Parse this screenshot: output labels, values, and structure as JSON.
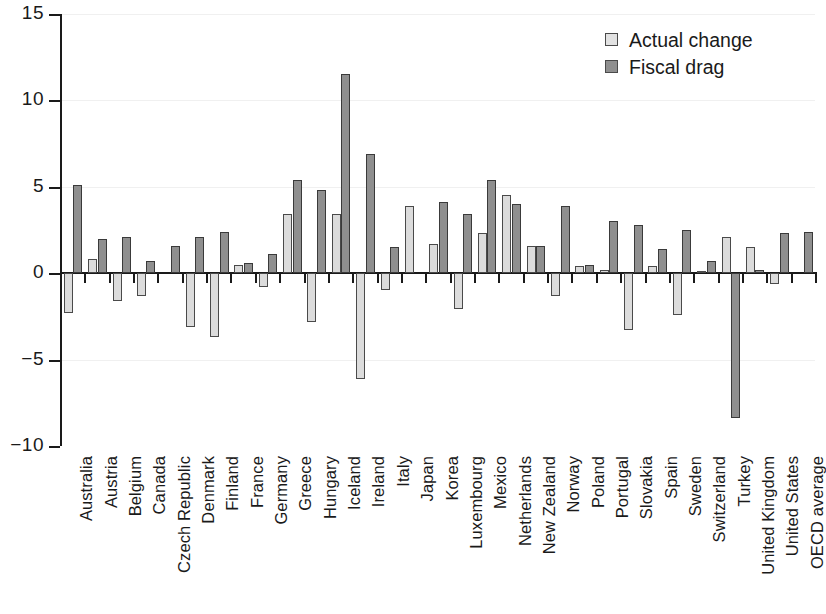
{
  "chart_data": {
    "type": "bar",
    "title": "",
    "subtitle": "",
    "xlabel": "",
    "ylabel": "",
    "ylim": [
      -10,
      15
    ],
    "yticks": [
      15,
      10,
      5,
      0,
      -5,
      -10
    ],
    "ytick_labels": [
      "15",
      "10",
      "5",
      "0",
      "−5",
      "−10"
    ],
    "grid": true,
    "legend_position": "top-right",
    "categories": [
      "Australia",
      "Austria",
      "Belgium",
      "Canada",
      "Czech Republic",
      "Denmark",
      "Finland",
      "France",
      "Germany",
      "Greece",
      "Hungary",
      "Iceland",
      "Ireland",
      "Italy",
      "Japan",
      "Korea",
      "Luxembourg",
      "Mexico",
      "Netherlands",
      "New Zealand",
      "Norway",
      "Poland",
      "Portugal",
      "Slovakia",
      "Spain",
      "Sweden",
      "Switzerland",
      "Turkey",
      "United Kingdom",
      "United States",
      "OECD average"
    ],
    "series": [
      {
        "name": "Actual change",
        "color": "#dcdcdc",
        "values": [
          -2.3,
          0.8,
          -1.6,
          -1.3,
          0.0,
          -3.1,
          -3.7,
          0.5,
          -0.8,
          3.4,
          -2.8,
          3.4,
          -6.1,
          -1.0,
          3.9,
          1.7,
          -2.1,
          2.3,
          4.5,
          1.6,
          -1.3,
          0.4,
          0.2,
          -3.3,
          0.4,
          -2.4,
          0.1,
          2.1,
          1.5,
          -0.6,
          0.0
        ]
      },
      {
        "name": "Fiscal drag",
        "color": "#8f8f8f",
        "values": [
          5.1,
          2.0,
          2.1,
          0.7,
          1.6,
          2.1,
          2.4,
          0.6,
          1.1,
          5.4,
          4.8,
          11.5,
          6.9,
          1.5,
          0.0,
          4.1,
          3.4,
          5.4,
          4.0,
          1.6,
          3.9,
          0.5,
          3.0,
          2.8,
          1.4,
          2.5,
          0.7,
          -8.4,
          0.2,
          2.3,
          2.4
        ]
      }
    ]
  },
  "legend": {
    "items": [
      {
        "label": "Actual change",
        "swatch": "actual"
      },
      {
        "label": "Fiscal drag",
        "swatch": "drag"
      }
    ]
  }
}
